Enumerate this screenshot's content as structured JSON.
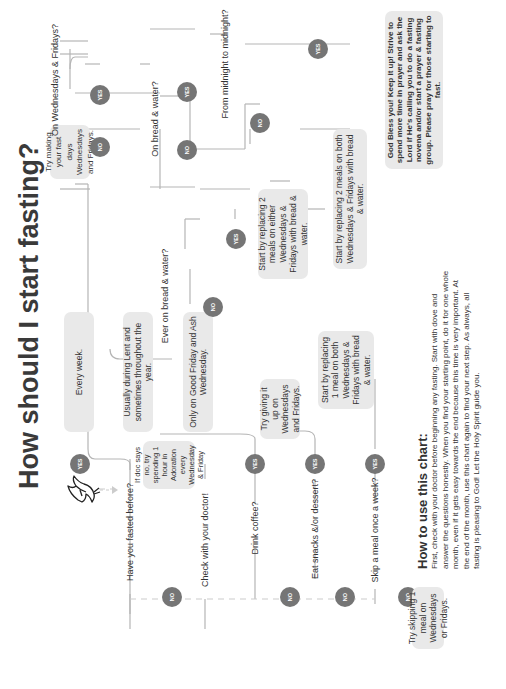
{
  "title": "How should I start fasting?",
  "colors": {
    "badge": "#757575",
    "box": "#e9e9e9",
    "line": "#b5b5b5",
    "dashed": "#cccccc",
    "text": "#333333"
  },
  "start_icon": "dove-icon",
  "badges": {
    "yes": "YES",
    "no": "NO"
  },
  "questions": {
    "fasted_before": "Have you fasted before?",
    "check_doctor": "Check with your doctor!",
    "drink_coffee": "Drink coffee?",
    "eat_snacks": "Eat snacks &/or dessert?",
    "skip_meal": "Skip a meal once a week?",
    "ever_bread_water": "Ever on bread & water?",
    "wed_fri": "On Wednesdays & Fridays?",
    "bread_water": "On bread & water?",
    "midnight": "From midnight to midnight?"
  },
  "boxes": {
    "every_week": "Every week.",
    "usually_lent": "Usually during Lent and sometimes throughout the year.",
    "good_friday": "Only on Good Friday and Ash Wednesday.",
    "doc_says_no": "If doc says no, try spending 1 hour in Adoration every Wednesday & Friday",
    "try_making": "Try making your fast days Wednesdays and Fridays.",
    "replace_2_either": "Start by replacing 2 meals on either Wednesdays & Fridays with bread & water.",
    "replace_1_both": "Start by replacing 1 meal on both Wednesdays & Fridays with bread & water.",
    "replace_2_both": "Start by replacing 2 meals on both Wednesdays & Fridays with bread & water.",
    "try_giving_up": "Try giving it up on Wednesdays and Fridays.",
    "try_skipping": "Try skipping 1 meal on Wednesdays or Fridays.",
    "god_bless": "God Bless you! Keep it up! Strive to spend more time in prayer and ask the Lord if He's calling you to do a fasting novena and/or start a prayer & fasting group. Please pray for those starting to fast."
  },
  "how_to": {
    "heading": "How to use this chart:",
    "body": "First, check with your doctor before beginning any fasting. Start with dove and answer the questions honestly. When you find your starting point, do it for one whole month, even if it gets easy towards the end because this time is very important. At the end of the month, use this chart again to find your next step. As always, all fasting is pleasing to God! Let the Holy Spirit guide you."
  }
}
